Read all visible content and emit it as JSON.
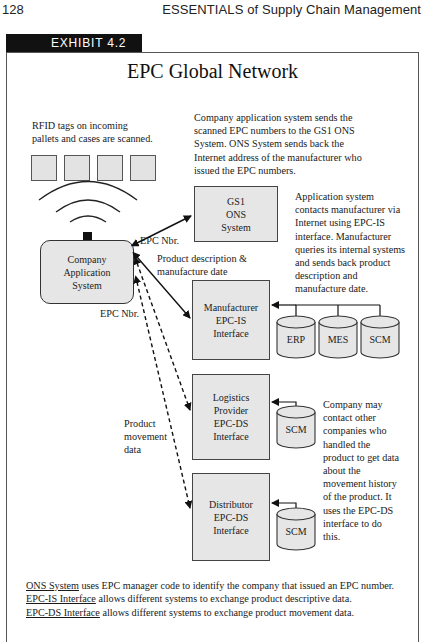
{
  "page": {
    "number": "128",
    "running_head": "ESSENTIALS of Supply Chain Management"
  },
  "exhibit": {
    "label": "EXHIBIT 4.2",
    "title": "EPC Global Network"
  },
  "diagram": {
    "rfid_note": [
      "RFID tags on incoming",
      "pallets and cases are scanned."
    ],
    "tags_count": 4,
    "company_system": [
      "Company",
      "Application",
      "System"
    ],
    "gs1_box": [
      "GS1",
      "ONS",
      "System"
    ],
    "manufacturer_box": [
      "Manufacturer",
      "EPC-IS",
      "Interface"
    ],
    "logistics_box": [
      "Logistics",
      "Provider",
      "EPC-DS",
      "Interface"
    ],
    "distributor_box": [
      "Distributor",
      "EPC-DS",
      "Interface"
    ],
    "manufacturer_databases": [
      "ERP",
      "MES",
      "SCM"
    ],
    "logistics_database": "SCM",
    "distributor_database": "SCM",
    "labels": {
      "epc_nbr_top": "EPC Nbr.",
      "product_description": [
        "Product description &",
        "manufacture date"
      ],
      "epc_nbr_lower": "EPC Nbr.",
      "product_movement": [
        "Product",
        "movement",
        "data"
      ]
    },
    "notes": {
      "ons_note": [
        "Company application system sends the",
        "scanned EPC numbers to the GS1 ONS",
        "System. ONS System sends back the",
        "Internet address of the manufacturer who",
        "issued the EPC numbers."
      ],
      "manufacturer_note": [
        "Application system",
        "contacts manufacturer via",
        "Internet using EPC-IS",
        "interface. Manufacturer",
        "queries its internal systems",
        "and sends back product",
        "description and",
        "manufacture date."
      ],
      "ds_note": [
        "Company may",
        "contact other",
        "companies who",
        "handled the",
        "product to get data",
        "about the",
        "movement history",
        "of the product.  It",
        "uses the EPC-DS",
        "interface to do",
        "this."
      ]
    }
  },
  "legend": [
    {
      "term": "ONS System",
      "text": " uses EPC manager code to identify the company that issued an EPC number."
    },
    {
      "term": "EPC-IS Interface",
      "text": " allows different systems to exchange product descriptive data."
    },
    {
      "term": "EPC-DS Interface",
      "text": " allows different systems to exchange product movement data."
    }
  ]
}
